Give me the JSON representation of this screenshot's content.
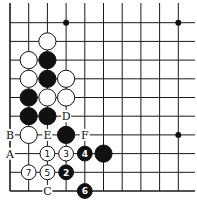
{
  "diagram": {
    "type": "go-board-fragment",
    "columns": 10,
    "rows": 11,
    "edges": [
      "left",
      "bottom"
    ],
    "hoshi": [
      [
        3,
        1
      ],
      [
        9,
        1
      ],
      [
        9,
        7
      ]
    ],
    "stones": [
      {
        "color": "white",
        "col": 2,
        "row": 2
      },
      {
        "color": "white",
        "col": 1,
        "row": 3
      },
      {
        "color": "black",
        "col": 2,
        "row": 3
      },
      {
        "color": "white",
        "col": 1,
        "row": 4
      },
      {
        "color": "black",
        "col": 2,
        "row": 4
      },
      {
        "color": "white",
        "col": 3,
        "row": 4
      },
      {
        "color": "black",
        "col": 1,
        "row": 5
      },
      {
        "color": "white",
        "col": 2,
        "row": 5
      },
      {
        "color": "white",
        "col": 3,
        "row": 5
      },
      {
        "color": "black",
        "col": 1,
        "row": 6
      },
      {
        "color": "black",
        "col": 2,
        "row": 6
      },
      {
        "color": "white",
        "col": 1,
        "row": 7
      },
      {
        "color": "black",
        "col": 3,
        "row": 7
      },
      {
        "color": "black",
        "col": 5,
        "row": 8
      },
      {
        "color": "white",
        "col": 2,
        "row": 8,
        "number": "1"
      },
      {
        "color": "black",
        "col": 3,
        "row": 9,
        "number": "2"
      },
      {
        "color": "white",
        "col": 3,
        "row": 8,
        "number": "3"
      },
      {
        "color": "black",
        "col": 4,
        "row": 8,
        "number": "4"
      },
      {
        "color": "white",
        "col": 2,
        "row": 9,
        "number": "5"
      },
      {
        "color": "black",
        "col": 4,
        "row": 10,
        "number": "6"
      },
      {
        "color": "white",
        "col": 1,
        "row": 9,
        "number": "7"
      }
    ],
    "labels": [
      {
        "text": "A",
        "col": 0,
        "row": 8
      },
      {
        "text": "B",
        "col": 0,
        "row": 7
      },
      {
        "text": "C",
        "col": 2,
        "row": 10
      },
      {
        "text": "D",
        "col": 3,
        "row": 6
      },
      {
        "text": "E",
        "col": 2,
        "row": 7
      },
      {
        "text": "F",
        "col": 4,
        "row": 7
      }
    ]
  }
}
